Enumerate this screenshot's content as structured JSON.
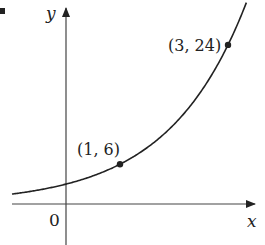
{
  "chart_data": {
    "type": "line",
    "title": "",
    "xlabel": "x",
    "ylabel": "y",
    "origin_label": "0",
    "function": "y = 3 * 2^x",
    "series": [
      {
        "name": "exponential curve",
        "x": [
          -1,
          -0.5,
          0,
          0.5,
          1,
          1.5,
          2,
          2.5,
          3,
          3.3
        ],
        "values": [
          1.5,
          2.12,
          3,
          4.24,
          6,
          8.49,
          12,
          16.97,
          24,
          29.5
        ]
      }
    ],
    "marked_points": [
      {
        "x": 1,
        "y": 6,
        "label": "(1, 6)"
      },
      {
        "x": 3,
        "y": 24,
        "label": "(3, 24)"
      }
    ],
    "grid": false,
    "legend": "none",
    "xlim": [
      -1.2,
      3.6
    ],
    "ylim": [
      -6,
      30
    ]
  },
  "axes": {
    "x_label": "x",
    "y_label": "y",
    "origin_label": "0"
  },
  "points": {
    "p1_label": "(1, 6)",
    "p2_label": "(3, 24)"
  },
  "colors": {
    "ink": "#222222",
    "background": "#ffffff"
  }
}
